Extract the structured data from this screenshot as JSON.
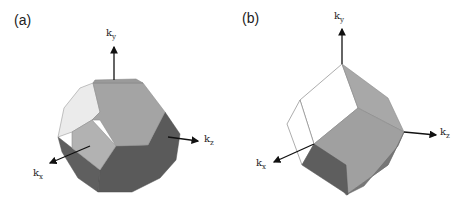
{
  "figure": {
    "panels": [
      {
        "label": "(a)",
        "shape": "truncated-octahedron",
        "axes": {
          "ky": "ky",
          "kx": "kx",
          "kz": "kz"
        },
        "axis_labels": {
          "ky_base": "k",
          "ky_sub": "y",
          "kx_base": "k",
          "kx_sub": "x",
          "kz_base": "k",
          "kz_sub": "z"
        }
      },
      {
        "label": "(b)",
        "shape": "rhombic-dodecahedron",
        "axes": {
          "ky": "ky",
          "kx": "kx",
          "kz": "kz"
        },
        "axis_labels": {
          "ky_base": "k",
          "ky_sub": "y",
          "kx_base": "k",
          "kx_sub": "x",
          "kz_base": "k",
          "kz_sub": "z"
        }
      }
    ],
    "colors": {
      "face_light": "#e6e6e6",
      "face_mid": "#a6a6a6",
      "face_dark": "#5f5f5f",
      "face_white": "#ffffff",
      "edge": "#8a8a8a",
      "axis": "#111111"
    }
  }
}
